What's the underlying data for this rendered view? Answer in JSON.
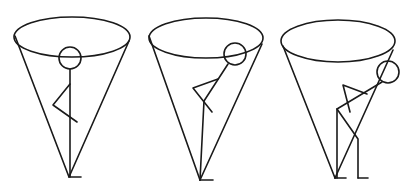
{
  "figure": {
    "stroke_color": "#1a1a1a",
    "background": "#ffffff"
  },
  "panels": [
    {
      "label": "",
      "posture": "upright",
      "cone": {
        "ellipse": {
          "cx": 72,
          "cy": 37,
          "rx": 58,
          "ry": 20
        },
        "left_top": [
          15,
          36
        ],
        "right_top": [
          129,
          41
        ],
        "apex": [
          69,
          177
        ]
      },
      "head": {
        "cx": 70,
        "cy": 58,
        "r": 11
      },
      "body": [
        [
          70,
          69
        ],
        [
          70,
          177
        ]
      ],
      "arm": [
        [
          70,
          84
        ],
        [
          53,
          105
        ],
        [
          77,
          122
        ]
      ],
      "feet": [
        [
          [
            70,
            177
          ],
          [
            81,
            177
          ]
        ]
      ]
    },
    {
      "label": "",
      "posture": "head forward",
      "cone": {
        "ellipse": {
          "cx": 206,
          "cy": 38,
          "rx": 57,
          "ry": 20
        },
        "left_top": [
          149,
          36
        ],
        "right_top": [
          262,
          44
        ],
        "apex": [
          200,
          180
        ]
      },
      "head": {
        "cx": 235,
        "cy": 54,
        "r": 11
      },
      "body": [
        [
          228,
          64
        ],
        [
          204,
          101
        ],
        [
          200,
          180
        ]
      ],
      "arm": [
        [
          218,
          79
        ],
        [
          193,
          88
        ],
        [
          212,
          112
        ]
      ],
      "feet": [
        [
          [
            200,
            180
          ],
          [
            213,
            180
          ]
        ]
      ]
    },
    {
      "label": "",
      "posture": "hunched",
      "cone": {
        "ellipse": {
          "cx": 338,
          "cy": 41,
          "rx": 57,
          "ry": 21
        },
        "left_top": [
          283,
          46
        ],
        "right_top": [
          393,
          50
        ],
        "apex": [
          335,
          178
        ]
      },
      "head": {
        "cx": 388,
        "cy": 72,
        "r": 11
      },
      "body": [
        [
          382,
          82
        ],
        [
          337,
          109
        ],
        [
          337,
          178
        ]
      ],
      "arm": [
        [
          367,
          94
        ],
        [
          343,
          85
        ],
        [
          350,
          112
        ]
      ],
      "leg": [
        [
          337,
          109
        ],
        [
          358,
          139
        ],
        [
          358,
          178
        ]
      ],
      "feet": [
        [
          [
            335,
            178
          ],
          [
            346,
            178
          ]
        ],
        [
          [
            358,
            178
          ],
          [
            368,
            178
          ]
        ]
      ]
    }
  ]
}
